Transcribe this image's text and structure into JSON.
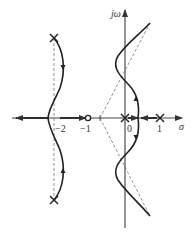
{
  "diagram": {
    "type": "root-locus",
    "axes": {
      "real_label": "σ",
      "imag_label": "jω"
    },
    "ticks": [
      {
        "value": -2,
        "label": "−2"
      },
      {
        "value": -1,
        "label": "−1"
      },
      {
        "value": 0,
        "label": "0"
      },
      {
        "value": 1,
        "label": "1"
      }
    ],
    "poles": [
      {
        "re": 0,
        "im": 0
      },
      {
        "re": 1,
        "im": 0
      },
      {
        "re": -2,
        "im": 2.3
      },
      {
        "re": -2,
        "im": -2.3
      }
    ],
    "zeros": [
      {
        "re": -1,
        "im": 0
      }
    ],
    "asymptote_centroid": -0.7,
    "colors": {
      "curve": "#222222",
      "axis": "#444444",
      "dashed": "#777777"
    }
  }
}
